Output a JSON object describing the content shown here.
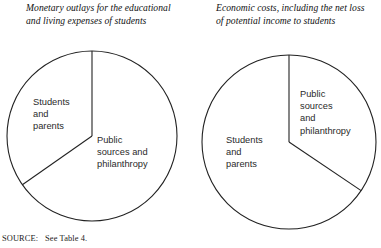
{
  "figure": {
    "source_label": "SOURCE:",
    "source_text": "See Table 4."
  },
  "charts": {
    "left": {
      "title": "Monetary outlays for the educational and living expenses of students",
      "labels": {
        "students": "Students\nand\nparents",
        "public": "Public\nsources and\nphilanthropy"
      }
    },
    "right": {
      "title": "Economic costs, including the net loss of potential income to students",
      "labels": {
        "public": "Public\nsources\nand\nphilanthropy",
        "students": "Students\nand\nparents"
      }
    }
  },
  "chart_data": [
    {
      "type": "pie",
      "title": "Monetary outlays for the educational and living expenses of students",
      "categories": [
        "Public sources and philanthropy",
        "Students and parents"
      ],
      "values": [
        65,
        35
      ],
      "units": "percent",
      "start_angle_deg": 0,
      "direction": "clockwise",
      "slice_angles_deg": [
        235,
        125
      ],
      "center": [
        92,
        136
      ],
      "radius": 85,
      "stroke": "#222222",
      "fill": "#ffffff",
      "legend": "inline-labels"
    },
    {
      "type": "pie",
      "title": "Economic costs, including the net loss of potential income to students",
      "categories": [
        "Public sources and philanthropy",
        "Students and parents"
      ],
      "values": [
        34,
        66
      ],
      "units": "percent",
      "start_angle_deg": 0,
      "direction": "clockwise",
      "slice_angles_deg": [
        124,
        236
      ],
      "center": [
        289,
        142
      ],
      "radius": 87,
      "stroke": "#222222",
      "fill": "#ffffff",
      "legend": "inline-labels"
    }
  ]
}
